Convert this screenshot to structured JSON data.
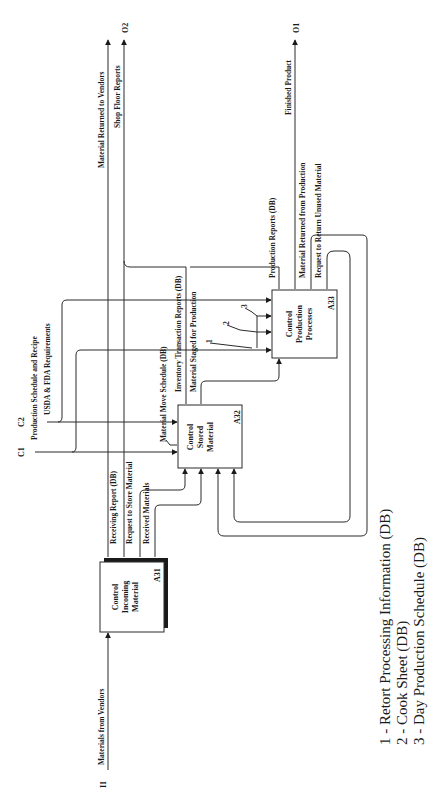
{
  "boxes": {
    "a31": {
      "id": "A31",
      "title": [
        "Control",
        "Incoming",
        "Material"
      ]
    },
    "a32": {
      "id": "A32",
      "title": [
        "Control",
        "Stored",
        "Material"
      ]
    },
    "a33": {
      "id": "A33",
      "title": [
        "Control",
        "Production",
        "Processes"
      ]
    }
  },
  "tags": {
    "i1": "I1",
    "c1": "C1",
    "c2": "C2",
    "o1": "O1",
    "o2": "O2"
  },
  "arrows": {
    "materials_from_vendors": "Materials from Vendors",
    "production_schedule_recipe": "Production Schedule and Recipe",
    "usda_fda": "USDA & FDA Requirements",
    "receiving_report": "Receiving Report (DB)",
    "request_to_store": "Request to Store Material",
    "received_materials": "Received Materials",
    "material_move_schedule": "Material Move Schedule (DB)",
    "inventory_transaction_reports": "Inventory Transaction Reports (DB)",
    "material_staged": "Material Staged for Production",
    "production_reports": "Production Reports (DB)",
    "material_returned_from_production": "Material Returned from Production",
    "request_return_unused": "Request to Return Unused Material",
    "finished_product": "Finished Product",
    "material_returned_to_vendors": "Material Returned to Vendors",
    "shop_floor_reports": "Shop Floor Reports",
    "mech_1": "1",
    "mech_2": "2",
    "mech_3": "3"
  },
  "legend": [
    "1 - Retort Processing Information (DB)",
    "2 - Cook Sheet (DB)",
    "3 - Day Production Schedule (DB)"
  ]
}
